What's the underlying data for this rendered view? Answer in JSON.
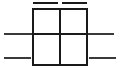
{
  "figure": {
    "type": "line-diagram",
    "canvas": {
      "width": 121,
      "height": 80,
      "background": "#ffffff"
    },
    "stroke": {
      "color": "#1a1a1a",
      "secondary_color": "#3a3a3a",
      "grid_width": 2.2,
      "rule_width": 2.6,
      "tick_width": 2.4,
      "linecap": "butt"
    },
    "grid_box": {
      "name": "two-by-two-grid",
      "x": 33,
      "y": 9,
      "width": 54,
      "height": 56,
      "columns": 2,
      "rows": 2,
      "mid_x": 60,
      "mid_y": 34,
      "cells": [
        {
          "name": "cell-top-left",
          "row": 0,
          "col": 0
        },
        {
          "name": "cell-top-right",
          "row": 0,
          "col": 1
        },
        {
          "name": "cell-bottom-left",
          "row": 1,
          "col": 0
        },
        {
          "name": "cell-bottom-right",
          "row": 1,
          "col": 1
        }
      ]
    },
    "top_ticks": [
      {
        "name": "top-tick-left",
        "x1": 33,
        "x2": 58,
        "y": 3
      },
      {
        "name": "top-tick-right",
        "x1": 62,
        "x2": 87,
        "y": 3
      }
    ],
    "side_rules": [
      {
        "name": "rule-middle-left",
        "x1": 4,
        "x2": 33,
        "y": 34
      },
      {
        "name": "rule-middle-right",
        "x1": 87,
        "x2": 114,
        "y": 34
      },
      {
        "name": "rule-lower-left",
        "x1": 4,
        "x2": 31,
        "y": 58
      },
      {
        "name": "rule-lower-right",
        "x1": 89,
        "x2": 116,
        "y": 58
      }
    ]
  }
}
